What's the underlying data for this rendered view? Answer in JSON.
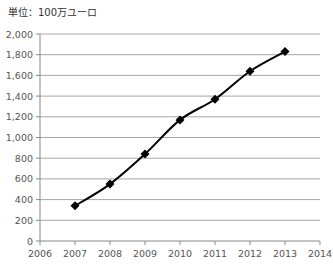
{
  "header": {
    "unit_label": "単位：100万ユーロ"
  },
  "chart_data": {
    "type": "line",
    "title": "",
    "unit": "単位：100万ユーロ",
    "xlabel": "",
    "ylabel": "",
    "x": [
      2007,
      2008,
      2009,
      2010,
      2011,
      2012,
      2013
    ],
    "series": [
      {
        "name": "",
        "values": [
          340,
          550,
          840,
          1170,
          1370,
          1640,
          1830
        ]
      }
    ],
    "xlim": [
      2006,
      2014
    ],
    "ylim": [
      0,
      2000
    ],
    "x_ticks": [
      "2006",
      "2007",
      "2008",
      "2009",
      "2010",
      "2011",
      "2012",
      "2013",
      "2014"
    ],
    "y_ticks": [
      "0",
      "200",
      "400",
      "600",
      "800",
      "1,000",
      "1,200",
      "1,400",
      "1,600",
      "1,800",
      "2,000"
    ],
    "grid": true,
    "legend": "none",
    "marker": "diamond",
    "line_color": "#000000",
    "grid_color": "#a6a6a6"
  }
}
